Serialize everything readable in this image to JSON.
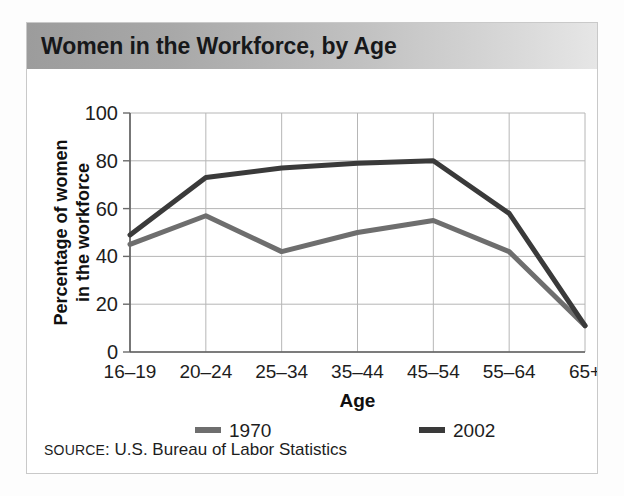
{
  "figure": {
    "title": "Women in the Workforce, by Age",
    "source_prefix": "SOURCE",
    "source_separator": ": ",
    "source_text": "U.S. Bureau of Labor Statistics",
    "banner_color_left": "#9c9c9c",
    "banner_color_right": "#e6e6e6",
    "border_color": "#c9c9c9"
  },
  "chart_data": {
    "type": "line",
    "title": "Women in the Workforce, by Age",
    "xlabel": "Age",
    "ylabel": "Percentage of women in the workforce",
    "ylabel_line1": "Percentage of women",
    "ylabel_line2": "in the workforce",
    "categories": [
      "16–19",
      "20–24",
      "25–34",
      "35–44",
      "45–54",
      "55–64",
      "65+"
    ],
    "ylim": [
      0,
      100
    ],
    "yticks": [
      0,
      20,
      40,
      60,
      80,
      100
    ],
    "ytick_labels": [
      "0",
      "20",
      "40",
      "60",
      "80",
      "100"
    ],
    "grid": true,
    "legend_position": "bottom",
    "series": [
      {
        "name": "1970",
        "color": "#6e6e6e",
        "width": 5,
        "values": [
          45,
          57,
          42,
          50,
          55,
          42,
          11
        ]
      },
      {
        "name": "2002",
        "color": "#3a3a3a",
        "width": 5,
        "values": [
          49,
          73,
          77,
          79,
          80,
          58,
          11
        ]
      }
    ]
  }
}
